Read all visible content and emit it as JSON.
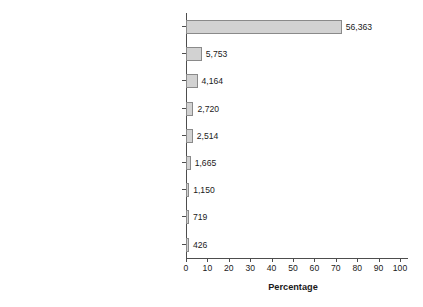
{
  "chart_data": {
    "type": "bar",
    "orientation": "horizontal",
    "title": "",
    "xlabel": "Percentage",
    "ylabel": "",
    "xlim": [
      0,
      100
    ],
    "xticks": [
      0,
      10,
      20,
      30,
      40,
      50,
      60,
      70,
      80,
      90,
      100
    ],
    "grid": false,
    "legend": null,
    "categories": [
      "Agricultural",
      "Industrial",
      "Personal service (domestic and other)",
      "Professional occupations",
      "Commercial",
      "Transport and communication",
      "Public administration and defence",
      "Other gainful occupations",
      "Clerks and typists"
    ],
    "value_labels": [
      "56,363",
      "5,753",
      "4,164",
      "2,720",
      "2,514",
      "1,665",
      "1,150",
      "719",
      "426"
    ],
    "counts": [
      56363,
      5753,
      4164,
      2720,
      2514,
      1665,
      1150,
      719,
      426
    ],
    "values": [
      72.8,
      7.4,
      5.4,
      3.5,
      3.2,
      2.2,
      1.5,
      0.9,
      0.6
    ],
    "bar_fill_color": "#d2d2d2",
    "bar_border_color": "#8a8a8a",
    "axis_color": "#4d4d4d",
    "text_color": "#1a1a1a",
    "background_color": "#ffffff"
  }
}
